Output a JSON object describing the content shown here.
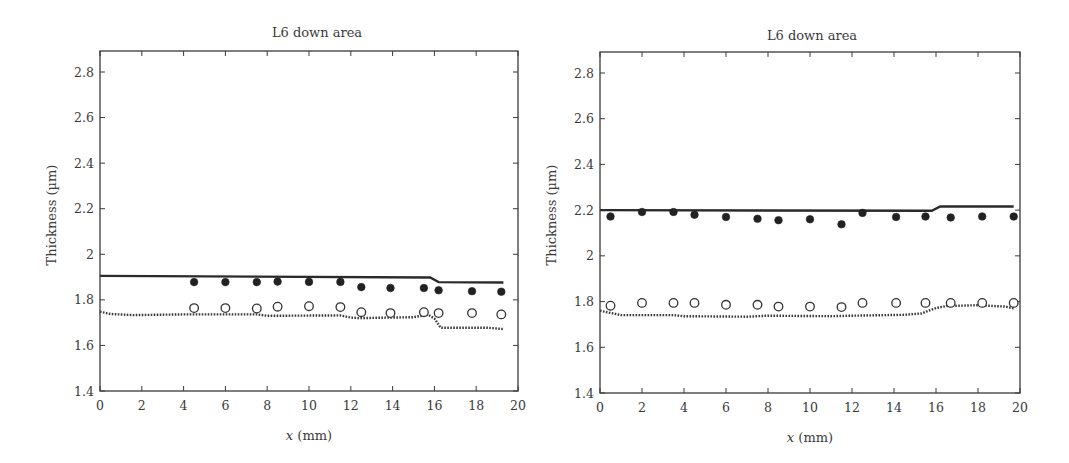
{
  "chart_data": [
    {
      "type": "scatter",
      "title": "L6 down area",
      "xlabel": "x (mm)",
      "xlabel_italic_part": "x",
      "xlabel_rest": " (mm)",
      "ylabel": "Thickness (µm)",
      "xlim": [
        0,
        20
      ],
      "ylim": [
        1.4,
        2.9
      ],
      "xticks": [
        0,
        2,
        4,
        6,
        8,
        10,
        12,
        14,
        16,
        18,
        20
      ],
      "yticks": [
        1.4,
        1.6,
        1.8,
        2,
        2.2,
        2.4,
        2.6,
        2.8
      ],
      "ytick_labels": [
        "1.4",
        "1.6",
        "1.8",
        "2",
        "2.2",
        "2.4",
        "2.6",
        "2.8"
      ],
      "grid": false,
      "legend": null,
      "series": [
        {
          "name": "upper layer simulation",
          "style": "solid-line",
          "x": [
            0,
            15.8,
            16.2,
            19.3
          ],
          "y": [
            1.905,
            1.898,
            1.878,
            1.876
          ]
        },
        {
          "name": "upper layer measured",
          "style": "filled-circle",
          "x": [
            4.5,
            6.0,
            7.5,
            8.5,
            10.0,
            11.5,
            12.5,
            13.9,
            15.5,
            16.2,
            17.8,
            19.2
          ],
          "y": [
            1.878,
            1.878,
            1.878,
            1.88,
            1.879,
            1.879,
            1.856,
            1.852,
            1.852,
            1.842,
            1.838,
            1.836
          ]
        },
        {
          "name": "lower layer simulation",
          "style": "dotted-line",
          "x": [
            0,
            0.5,
            1.6,
            4.0,
            7.5,
            8.0,
            11.5,
            12.0,
            12.4,
            15.0,
            15.7,
            16.0,
            16.3,
            18.5,
            19.3
          ],
          "y": [
            1.748,
            1.738,
            1.733,
            1.736,
            1.736,
            1.73,
            1.732,
            1.722,
            1.72,
            1.724,
            1.735,
            1.718,
            1.678,
            1.678,
            1.672
          ]
        },
        {
          "name": "lower layer measured",
          "style": "open-circle",
          "x": [
            4.5,
            6.0,
            7.5,
            8.5,
            10.0,
            11.5,
            12.5,
            13.9,
            15.5,
            16.2,
            17.8,
            19.2
          ],
          "y": [
            1.764,
            1.764,
            1.762,
            1.77,
            1.772,
            1.768,
            1.746,
            1.742,
            1.746,
            1.742,
            1.742,
            1.736
          ]
        }
      ]
    },
    {
      "type": "scatter",
      "title": "L6 down area",
      "xlabel": "x (mm)",
      "xlabel_italic_part": "x",
      "xlabel_rest": " (mm)",
      "ylabel": "Thickness (µm)",
      "xlim": [
        0,
        20
      ],
      "ylim": [
        1.4,
        2.9
      ],
      "xticks": [
        0,
        2,
        4,
        6,
        8,
        10,
        12,
        14,
        16,
        18,
        20
      ],
      "yticks": [
        1.4,
        1.6,
        1.8,
        2,
        2.2,
        2.4,
        2.6,
        2.8
      ],
      "ytick_labels": [
        "1.4",
        "1.6",
        "1.8",
        "2",
        "2.2",
        "2.4",
        "2.6",
        "2.8"
      ],
      "grid": false,
      "legend": null,
      "series": [
        {
          "name": "upper layer simulation",
          "style": "solid-line",
          "x": [
            0,
            15.8,
            16.2,
            19.7
          ],
          "y": [
            2.2,
            2.197,
            2.216,
            2.216
          ]
        },
        {
          "name": "upper layer measured",
          "style": "filled-circle",
          "x": [
            0.5,
            2.0,
            3.5,
            4.5,
            6.0,
            7.5,
            8.5,
            10.0,
            11.5,
            12.5,
            14.1,
            15.5,
            16.7,
            18.2,
            19.7
          ],
          "y": [
            2.172,
            2.192,
            2.192,
            2.18,
            2.17,
            2.162,
            2.156,
            2.16,
            2.138,
            2.188,
            2.17,
            2.172,
            2.168,
            2.172,
            2.172
          ]
        },
        {
          "name": "lower layer simulation",
          "style": "dotted-line",
          "x": [
            0,
            0.4,
            1.0,
            3.5,
            4.0,
            7.0,
            8.0,
            11.0,
            12.0,
            14.5,
            15.3,
            16.0,
            16.5,
            18.0,
            19.3,
            19.7
          ],
          "y": [
            1.76,
            1.752,
            1.741,
            1.741,
            1.736,
            1.734,
            1.738,
            1.736,
            1.738,
            1.742,
            1.748,
            1.772,
            1.78,
            1.784,
            1.778,
            1.77
          ]
        },
        {
          "name": "lower layer measured",
          "style": "open-circle",
          "x": [
            0.5,
            2.0,
            3.5,
            4.5,
            6.0,
            7.5,
            8.5,
            10.0,
            11.5,
            12.5,
            14.1,
            15.5,
            16.7,
            18.2,
            19.7
          ],
          "y": [
            1.782,
            1.794,
            1.794,
            1.794,
            1.786,
            1.786,
            1.778,
            1.778,
            1.776,
            1.794,
            1.794,
            1.794,
            1.794,
            1.794,
            1.794
          ]
        }
      ]
    }
  ],
  "layout": {
    "panels": [
      {
        "left": 100,
        "right": 518,
        "top": 51,
        "bottom": 391,
        "ytop_value": 2.8,
        "ytop_px": 72,
        "title_x": 317,
        "title_y": 37,
        "ylabel_x": 56,
        "ylabel_y": 215,
        "xlabel_y": 440
      },
      {
        "left": 600,
        "right": 1020,
        "top": 52,
        "bottom": 393,
        "ytop_value": 2.8,
        "ytop_px": 73,
        "title_x": 812,
        "title_y": 40,
        "ylabel_x": 556,
        "ylabel_y": 215,
        "xlabel_y": 442
      }
    ]
  }
}
